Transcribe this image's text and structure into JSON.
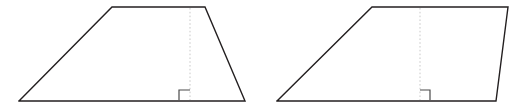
{
  "canvas": {
    "width": 520,
    "height": 109,
    "background_color": "#ffffff"
  },
  "style": {
    "outline_color": "#231f20",
    "outline_width": 1.4,
    "altitude_color": "#c9c9c9",
    "altitude_width": 1,
    "altitude_dash": "1.6 2.2",
    "right_angle_color": "#4a4a4a",
    "right_angle_width": 1.2
  },
  "figures": [
    {
      "name": "isosceles-trapezoid",
      "label": "Left figure",
      "outline_points": "19,101 112,7 205,7 245,101 19,101",
      "vertices": [
        {
          "name": "bottom-left",
          "x": 19,
          "y": 101
        },
        {
          "name": "top-left",
          "x": 112,
          "y": 7
        },
        {
          "name": "top-right",
          "x": 205,
          "y": 7
        },
        {
          "name": "bottom-right",
          "x": 245,
          "y": 101
        }
      ],
      "altitude": {
        "name": "height-segment",
        "x": 190,
        "y_top": 8,
        "y_bottom": 100,
        "length": 92
      },
      "right_angle": {
        "name": "right-angle-marker",
        "opens": "left",
        "size": 10,
        "path": "M 179,100 L 179,90 L 190,90"
      }
    },
    {
      "name": "parallelogram",
      "label": "Right figure",
      "outline_points": "277,101 372,7 508,7 496,101 277,101",
      "vertices": [
        {
          "name": "bottom-left",
          "x": 277,
          "y": 101
        },
        {
          "name": "top-left",
          "x": 372,
          "y": 7
        },
        {
          "name": "top-right",
          "x": 508,
          "y": 7
        },
        {
          "name": "bottom-right",
          "x": 496,
          "y": 101
        }
      ],
      "altitude": {
        "name": "height-segment",
        "x": 420,
        "y_top": 8,
        "y_bottom": 100,
        "length": 92
      },
      "right_angle": {
        "name": "right-angle-marker",
        "opens": "right",
        "size": 10,
        "path": "M 420,90 L 430,90 L 430,100"
      }
    }
  ]
}
